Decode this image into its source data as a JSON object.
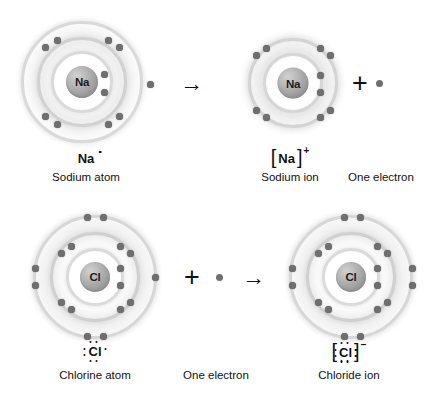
{
  "diagram": {
    "background_color": "#ffffff",
    "nucleus_color": "#9a9a9a",
    "electron_color": "#6f6f6f",
    "shell_color": "#bdbdbd",
    "text_color": "#111111"
  },
  "rows": [
    {
      "id": "sodium-row",
      "items": [
        {
          "kind": "atom",
          "name": "sodium-atom",
          "nucleus_label": "Na",
          "symbol": "Na",
          "symbol_charge": "",
          "caption": "Sodium atom",
          "shell_counts": [
            2,
            8,
            1
          ],
          "bracketed": false
        },
        {
          "kind": "operator",
          "name": "reaction-arrow",
          "glyph": "→"
        },
        {
          "kind": "atom",
          "name": "sodium-ion",
          "nucleus_label": "Na",
          "symbol": "Na",
          "symbol_charge": "+",
          "caption": "Sodium ion",
          "shell_counts": [
            2,
            8
          ],
          "bracketed": true
        },
        {
          "kind": "operator",
          "name": "plus-operator",
          "glyph": "+"
        },
        {
          "kind": "electron",
          "name": "free-electron",
          "caption": "One electron"
        }
      ]
    },
    {
      "id": "chlorine-row",
      "items": [
        {
          "kind": "atom",
          "name": "chlorine-atom",
          "nucleus_label": "Cl",
          "symbol": "Cl",
          "symbol_charge": "",
          "caption": "Chlorine atom",
          "shell_counts": [
            2,
            8,
            7
          ],
          "bracketed": false
        },
        {
          "kind": "operator",
          "name": "plus-operator",
          "glyph": "+"
        },
        {
          "kind": "electron",
          "name": "free-electron",
          "caption": "One electron"
        },
        {
          "kind": "operator",
          "name": "reaction-arrow",
          "glyph": "→"
        },
        {
          "kind": "atom",
          "name": "chloride-ion",
          "nucleus_label": "Cl",
          "symbol": "Cl",
          "symbol_charge": "−",
          "caption": "Chloride ion",
          "shell_counts": [
            2,
            8,
            8
          ],
          "bracketed": true
        }
      ]
    }
  ],
  "labels": {
    "sodium_atom_nucleus": "Na",
    "sodium_ion_nucleus": "Na",
    "chlorine_atom_nucleus": "Cl",
    "chloride_ion_nucleus": "Cl",
    "sodium_atom_caption": "Sodium atom",
    "sodium_ion_caption": "Sodium ion",
    "one_electron_top_caption": "One electron",
    "chlorine_atom_caption": "Chlorine atom",
    "one_electron_bottom_caption": "One electron",
    "chloride_ion_caption": "Chloride ion",
    "sodium_symbol": "Na",
    "sodium_ion_symbol": "Na",
    "sodium_ion_charge": "+",
    "chlorine_symbol": "Cl",
    "chloride_symbol": "Cl",
    "chloride_charge": "−",
    "arrow_glyph": "→",
    "plus_glyph": "+",
    "bracket_left": "[",
    "bracket_right": "]"
  }
}
